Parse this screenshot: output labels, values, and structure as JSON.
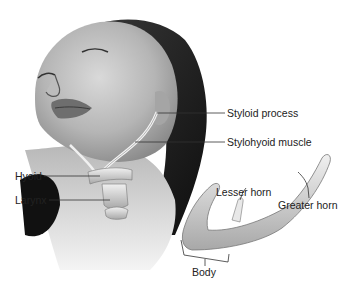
{
  "figure": {
    "labels": {
      "styloid_process": "Styloid process",
      "stylohyoid_muscle": "Stylohyoid muscle",
      "hyoid": "Hyoid",
      "larynx": "Larynx",
      "lesser_horn": "Lesser horn",
      "greater_horn": "Greater horn",
      "body": "Body"
    }
  }
}
